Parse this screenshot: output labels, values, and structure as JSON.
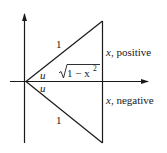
{
  "diagram": {
    "labels": {
      "hyp_upper": "1",
      "hyp_lower": "1",
      "angle_upper": "u",
      "angle_lower": "u",
      "adjacent_sqrt": "1 − x",
      "adjacent_exp": "2",
      "right_upper_var": "x",
      "right_upper_text": ", positive",
      "right_lower_var": "x",
      "right_lower_text": ", negative"
    },
    "colors": {
      "stroke": "#1a1a1a",
      "background": "#ffffff"
    }
  }
}
